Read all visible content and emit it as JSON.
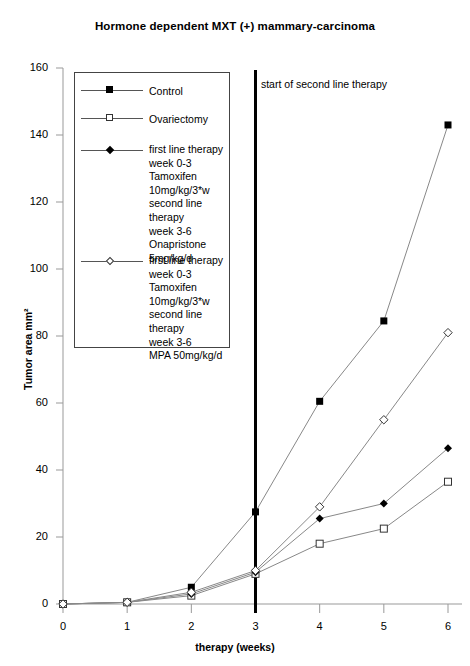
{
  "chart_data": {
    "type": "line",
    "title": "Hormone dependent MXT (+) mammary-carcinoma",
    "xlabel": "therapy (weeks)",
    "ylabel": "Tumor area mm²",
    "x": [
      0,
      1,
      2,
      3,
      4,
      5,
      6
    ],
    "xlim": [
      0,
      6
    ],
    "ylim": [
      0,
      160
    ],
    "xticks": [
      "0",
      "1",
      "2",
      "3",
      "4",
      "5",
      "6"
    ],
    "yticks": [
      "0",
      "20",
      "40",
      "60",
      "80",
      "100",
      "120",
      "140",
      "160"
    ],
    "grid": false,
    "legend_position": "upper-left-inset",
    "series": [
      {
        "name": "Control",
        "marker": "filled-square",
        "values": [
          0,
          0.5,
          5,
          27.5,
          60.5,
          84.5,
          143
        ]
      },
      {
        "name": "Ovariectomy",
        "marker": "open-square",
        "values": [
          0,
          0.5,
          2.5,
          9,
          18,
          22.5,
          36.5
        ]
      },
      {
        "name": "first line therapy week 0-3 Tamoxifen 10mg/kg/3*w second line therapy week 3-6 Onapristone 5mg/kg/d",
        "marker": "filled-diamond",
        "values": [
          0,
          0.5,
          3,
          9.5,
          25.5,
          30,
          46.5
        ]
      },
      {
        "name": "first line therapy week 0-3 Tamoxifen 10mg/kg/3*w second line therapy week 3-6 MPA 50mg/kg/d",
        "marker": "open-diamond",
        "values": [
          0,
          0.5,
          3.5,
          10,
          29,
          55,
          81
        ]
      }
    ],
    "annotations": [
      {
        "text": "start of second\nline therapy",
        "x": 3,
        "type": "vertical-line-label"
      }
    ]
  },
  "legend": {
    "entries": [
      {
        "marker": "filled-square",
        "label": "Control"
      },
      {
        "marker": "open-square",
        "label": "Ovariectomy"
      },
      {
        "marker": "filled-diamond",
        "label": "first line therapy\nweek 0-3\nTamoxifen\n10mg/kg/3*w\nsecond line therapy\nweek 3-6\nOnapristone\n5mg/kg/d"
      },
      {
        "marker": "open-diamond",
        "label": "first line therapy\n week 0-3\nTamoxifen\n10mg/kg/3*w\nsecond line therapy\n week 3-6\nMPA 50mg/kg/d"
      }
    ]
  },
  "colors": {
    "line": "#888888",
    "marker": "#000000",
    "axis": "#999999",
    "vertical_marker": "#000000",
    "text": "#000000"
  }
}
